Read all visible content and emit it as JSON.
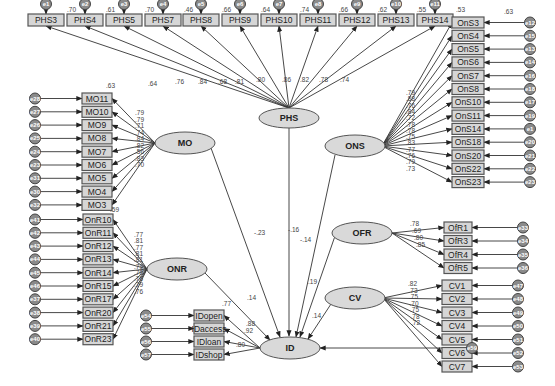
{
  "diagram": {
    "type": "structural equation model",
    "outcome_latent": {
      "name": "ID",
      "error": "e59"
    },
    "latents": [
      {
        "name": "PHS",
        "path_to_ID": "-.16"
      },
      {
        "name": "MO",
        "path_to_ID": "-.23"
      },
      {
        "name": "ONS",
        "path_to_ID": "-.14"
      },
      {
        "name": "OFR",
        "path_to_ID": ".19"
      },
      {
        "name": "ONR",
        "path_to_ID": ".14"
      },
      {
        "name": "CV",
        "path_to_ID": ".14"
      }
    ],
    "phs_indicators": [
      {
        "label": "PHS3",
        "loading": ".63",
        "r2": ".70",
        "error": "e1"
      },
      {
        "label": "PHS4",
        "loading": ".64",
        "r2": ".61",
        "error": "e2"
      },
      {
        "label": "PHS5",
        "loading": ".76",
        "r2": ".70",
        "error": "e3"
      },
      {
        "label": "PHS7",
        "loading": ".84",
        "r2": ".46",
        "error": "e4"
      },
      {
        "label": "PHS8",
        "loading": ".68",
        "r2": ".66",
        "error": "e5"
      },
      {
        "label": "PHS9",
        "loading": ".81",
        "r2": ".64",
        "error": "e6"
      },
      {
        "label": "PHS10",
        "loading": ".80",
        "r2": ".74",
        "error": "e7"
      },
      {
        "label": "PHS11",
        "loading": ".86",
        "r2": ".66",
        "error": "e8"
      },
      {
        "label": "PHS12",
        "loading": ".82",
        "r2": ".62",
        "error": "e9"
      },
      {
        "label": "PHS13",
        "loading": ".78",
        "r2": ".55",
        "error": "e10"
      },
      {
        "label": "PHS14",
        "loading": ".74",
        "r2": ".53",
        "error": "e11"
      }
    ],
    "phs_extra_loading": ".73",
    "mo_indicators": [
      {
        "label": "MO11",
        "loading": ".79",
        "error": "e28"
      },
      {
        "label": "MO10",
        "loading": ".79",
        "error": "e27"
      },
      {
        "label": "MO9",
        "loading": ".71",
        "error": "e26"
      },
      {
        "label": "MO8",
        "loading": ".74",
        "error": "e25"
      },
      {
        "label": "MO7",
        "loading": ".84",
        "error": "e24"
      },
      {
        "label": "MO6",
        "loading": ".82",
        "error": "e23"
      },
      {
        "label": "MO5",
        "loading": ".56",
        "error": "e31"
      },
      {
        "label": "MO4",
        "loading": ".83",
        "error": "e30"
      },
      {
        "label": "MO3",
        "loading": ".70",
        "error": "e32"
      }
    ],
    "mo_r2_bottom": ".59",
    "ons_indicators": [
      {
        "label": "OnS3",
        "loading": ".79",
        "r2": ".63",
        "error": "e12"
      },
      {
        "label": "OnS4",
        "loading": ".88",
        "error": "e15"
      },
      {
        "label": "OnS5",
        "loading": ".76",
        "error": "e13"
      },
      {
        "label": "OnS6",
        "loading": ".84",
        "error": "e14"
      },
      {
        "label": "OnS7",
        "loading": ".72",
        "error": "e16"
      },
      {
        "label": "OnS8",
        "loading": ".78",
        "error": "e18"
      },
      {
        "label": "OnS10",
        "loading": ".78",
        "error": "e17"
      },
      {
        "label": "OnS11",
        "loading": ".75",
        "error": "e19"
      },
      {
        "label": "OnS14",
        "loading": ".83",
        "error": "e1"
      },
      {
        "label": "OnS18",
        "loading": ".77",
        "error": "e20"
      },
      {
        "label": "OnS20",
        "loading": ".76",
        "error": "e21"
      },
      {
        "label": "OnS22",
        "loading": ".79",
        "error": "e22"
      },
      {
        "label": "OnS23",
        "loading": ".73",
        "error": "e23"
      }
    ],
    "ofr_indicators": [
      {
        "label": "OfR1",
        "loading": ".78",
        "error": "e33"
      },
      {
        "label": "OfR3",
        "loading": ".69",
        "error": "e34"
      },
      {
        "label": "OfR4",
        "loading": ".80",
        "error": "e35"
      },
      {
        "label": "OfR5",
        "loading": ".85",
        "error": "e36"
      }
    ],
    "onr_indicators": [
      {
        "label": "OnR10",
        "loading": ".77",
        "error": "e41"
      },
      {
        "label": "OnR11",
        "loading": ".81",
        "error": "e42"
      },
      {
        "label": "OnR12",
        "loading": ".77",
        "error": "e43"
      },
      {
        "label": "OnR13",
        "loading": ".81",
        "error": "e44"
      },
      {
        "label": "OnR14",
        "loading": ".81",
        "error": "e45"
      },
      {
        "label": "OnR15",
        "loading": ".79",
        "error": "e46"
      },
      {
        "label": "OnR17",
        "loading": ".78",
        "error": "e37"
      },
      {
        "label": "OnR20",
        "loading": ".76",
        "error": "e38"
      },
      {
        "label": "OnR21",
        "loading": ".79",
        "error": "e39"
      },
      {
        "label": "OnR23",
        "loading": ".76",
        "error": "e40"
      }
    ],
    "cv_indicators": [
      {
        "label": "CV1",
        "loading": ".82",
        "error": "e47"
      },
      {
        "label": "CV2",
        "loading": ".73",
        "error": "e48"
      },
      {
        "label": "CV3",
        "loading": ".75",
        "error": "e49"
      },
      {
        "label": "CV4",
        "loading": ".70",
        "error": "e50"
      },
      {
        "label": "CV5",
        "loading": ".75",
        "error": "e51"
      },
      {
        "label": "CV6",
        "loading": ".78",
        "error": "e52"
      },
      {
        "label": "CV7",
        "loading": ".72",
        "error": "e53"
      }
    ],
    "id_indicators": [
      {
        "label": "IDopen",
        "loading": ".77",
        "error": "e54"
      },
      {
        "label": "IDaccess",
        "loading": ".88",
        "error": "e55"
      },
      {
        "label": "IDloan",
        "loading": ".92",
        "error": "e56"
      },
      {
        "label": "IDshop",
        "loading": ".80",
        "error": "e57"
      }
    ],
    "id_loading_extra": ".87"
  }
}
